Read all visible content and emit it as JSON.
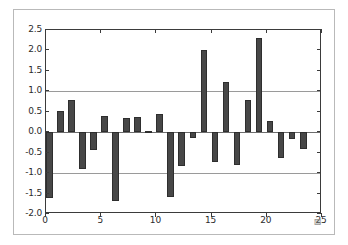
{
  "chart_data": {
    "type": "bar",
    "title": "",
    "xlabel": "",
    "ylabel": "",
    "x": [
      0,
      1,
      2,
      3,
      4,
      5,
      6,
      7,
      8,
      9,
      10,
      11,
      12,
      13,
      14,
      15,
      16,
      17,
      18,
      19,
      20,
      21,
      22,
      23
    ],
    "values": [
      -1.62,
      0.53,
      0.79,
      -0.89,
      -0.43,
      0.39,
      -1.67,
      0.36,
      0.37,
      0.02,
      0.45,
      -1.58,
      -0.83,
      -0.14,
      2.0,
      -0.74,
      1.22,
      -0.79,
      0.8,
      2.31,
      0.27,
      -0.63,
      -0.17,
      -0.42
    ],
    "categories": [
      "0",
      "1",
      "2",
      "3",
      "4",
      "5",
      "6",
      "7",
      "8",
      "9",
      "10",
      "11",
      "12",
      "13",
      "14",
      "15",
      "16",
      "17",
      "18",
      "19",
      "20",
      "21",
      "22",
      "23"
    ],
    "ylim": [
      -2.0,
      2.5
    ],
    "xlim": [
      0,
      25
    ],
    "yticks": [
      "2.5",
      "2.0",
      "1.5",
      "1.0",
      "0.5",
      "0.0",
      "-0.5",
      "-1.0",
      "-1.5",
      "-2.0"
    ],
    "ytick_values": [
      2.5,
      2.0,
      1.5,
      1.0,
      0.5,
      0.0,
      -0.5,
      -1.0,
      -1.5,
      -2.0
    ],
    "xticks": [
      "0",
      "5",
      "10",
      "15",
      "20",
      "25"
    ],
    "xtick_values": [
      0,
      5,
      10,
      15,
      20,
      25
    ],
    "gridlines_y": [
      1.0,
      -1.0
    ],
    "grid": true,
    "legend": null,
    "bar_color": "#474747",
    "bar_edge_color": "#2e2e2e",
    "grid_color": "#9a9a9a",
    "axis_color": "#3b3b3b",
    "background_color": "#ffffff",
    "bar_width": 0.6
  },
  "figure": {
    "frame_color": "#b9b9b9",
    "artifact_glyph": "▨"
  }
}
